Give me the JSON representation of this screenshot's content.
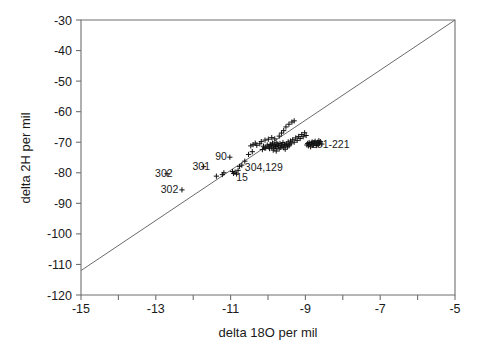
{
  "chart_data": {
    "type": "scatter",
    "title": "",
    "xlabel": "delta 18O  per mil",
    "ylabel": "delta 2H  per mil",
    "xlim": [
      -15,
      -5
    ],
    "ylim": [
      -120,
      -30
    ],
    "xticks": [
      -15,
      -14,
      -13,
      -12,
      -11,
      -10,
      -9,
      -8,
      -7,
      -6,
      -5
    ],
    "xtick_labels": [
      "-15",
      "",
      "-13",
      "",
      "-11",
      "",
      "-9",
      "",
      "-7",
      "",
      "-5"
    ],
    "yticks": [
      -120,
      -110,
      -100,
      -90,
      -80,
      -70,
      -60,
      -50,
      -40,
      -30
    ],
    "ytick_labels": [
      "-120",
      "-110",
      "-100",
      "-90",
      "-80",
      "-70",
      "-60",
      "-50",
      "-40",
      "-30"
    ],
    "grid": false,
    "legend": "none",
    "marker_symbol": "plus",
    "marker_color": "#111111",
    "reference_line": {
      "name": "meteoric-water-line",
      "x": [
        -15,
        -5
      ],
      "y": [
        -112.0,
        -30.0
      ],
      "color": "#6b6b6b"
    },
    "annotations": [
      {
        "text": "302",
        "x": -12.55,
        "y": -80.2,
        "anchor": "end"
      },
      {
        "text": "302",
        "x": -12.4,
        "y": -85.5,
        "anchor": "end"
      },
      {
        "text": "301",
        "x": -11.55,
        "y": -77.8,
        "anchor": "end"
      },
      {
        "text": "90",
        "x": -11.1,
        "y": -74.6,
        "anchor": "end"
      },
      {
        "text": "15",
        "x": -10.85,
        "y": -81.4,
        "anchor": "start"
      },
      {
        "text": "304,129",
        "x": -10.62,
        "y": -78.3,
        "anchor": "start"
      },
      {
        "text": "201-221",
        "x": -8.85,
        "y": -70.6,
        "anchor": "start"
      }
    ],
    "points": [
      {
        "x": -12.7,
        "y": -80.3
      },
      {
        "x": -12.3,
        "y": -85.6
      },
      {
        "x": -11.72,
        "y": -78.0
      },
      {
        "x": -11.38,
        "y": -81.1
      },
      {
        "x": -11.22,
        "y": -80.6
      },
      {
        "x": -11.18,
        "y": -80.0
      },
      {
        "x": -11.02,
        "y": -74.9
      },
      {
        "x": -10.95,
        "y": -79.6
      },
      {
        "x": -10.92,
        "y": -80.2
      },
      {
        "x": -10.88,
        "y": -79.8
      },
      {
        "x": -10.84,
        "y": -80.4
      },
      {
        "x": -10.8,
        "y": -79.2
      },
      {
        "x": -10.76,
        "y": -77.9
      },
      {
        "x": -10.7,
        "y": -77.5
      },
      {
        "x": -10.62,
        "y": -76.2
      },
      {
        "x": -10.52,
        "y": -74.0
      },
      {
        "x": -10.42,
        "y": -73.1
      },
      {
        "x": -10.3,
        "y": -71.0
      },
      {
        "x": -10.22,
        "y": -70.5
      },
      {
        "x": -10.12,
        "y": -71.3
      },
      {
        "x": -10.06,
        "y": -71.8
      },
      {
        "x": -10.02,
        "y": -70.9
      },
      {
        "x": -9.98,
        "y": -71.5
      },
      {
        "x": -9.96,
        "y": -72.1
      },
      {
        "x": -9.94,
        "y": -70.7
      },
      {
        "x": -9.92,
        "y": -71.0
      },
      {
        "x": -9.9,
        "y": -71.6
      },
      {
        "x": -9.88,
        "y": -70.3
      },
      {
        "x": -9.86,
        "y": -71.2
      },
      {
        "x": -9.84,
        "y": -72.0
      },
      {
        "x": -9.82,
        "y": -70.8
      },
      {
        "x": -9.8,
        "y": -71.4
      },
      {
        "x": -9.78,
        "y": -70.2
      },
      {
        "x": -9.76,
        "y": -71.9
      },
      {
        "x": -9.74,
        "y": -70.6
      },
      {
        "x": -9.72,
        "y": -71.1
      },
      {
        "x": -9.7,
        "y": -72.2
      },
      {
        "x": -9.68,
        "y": -70.4
      },
      {
        "x": -9.66,
        "y": -71.7
      },
      {
        "x": -9.64,
        "y": -70.9
      },
      {
        "x": -9.62,
        "y": -71.3
      },
      {
        "x": -9.6,
        "y": -70.1
      },
      {
        "x": -9.58,
        "y": -71.8
      },
      {
        "x": -9.56,
        "y": -70.7
      },
      {
        "x": -9.54,
        "y": -72.3
      },
      {
        "x": -9.52,
        "y": -71.0
      },
      {
        "x": -9.5,
        "y": -70.5
      },
      {
        "x": -9.48,
        "y": -71.5
      },
      {
        "x": -9.46,
        "y": -69.9
      },
      {
        "x": -9.44,
        "y": -71.2
      },
      {
        "x": -9.42,
        "y": -70.8
      },
      {
        "x": -9.4,
        "y": -69.6
      },
      {
        "x": -9.38,
        "y": -70.3
      },
      {
        "x": -9.34,
        "y": -69.2
      },
      {
        "x": -9.3,
        "y": -70.0
      },
      {
        "x": -9.26,
        "y": -68.6
      },
      {
        "x": -9.22,
        "y": -69.4
      },
      {
        "x": -9.18,
        "y": -68.1
      },
      {
        "x": -9.14,
        "y": -68.8
      },
      {
        "x": -9.1,
        "y": -67.5
      },
      {
        "x": -9.06,
        "y": -68.2
      },
      {
        "x": -9.02,
        "y": -66.9
      },
      {
        "x": -8.98,
        "y": -67.8
      },
      {
        "x": -8.96,
        "y": -70.9
      },
      {
        "x": -8.94,
        "y": -70.4
      },
      {
        "x": -8.92,
        "y": -71.2
      },
      {
        "x": -8.9,
        "y": -70.1
      },
      {
        "x": -8.88,
        "y": -70.7
      },
      {
        "x": -8.86,
        "y": -71.5
      },
      {
        "x": -8.84,
        "y": -70.3
      },
      {
        "x": -8.82,
        "y": -69.9
      },
      {
        "x": -8.8,
        "y": -70.6
      },
      {
        "x": -8.78,
        "y": -71.0
      },
      {
        "x": -8.76,
        "y": -70.2
      },
      {
        "x": -8.74,
        "y": -69.7
      },
      {
        "x": -8.72,
        "y": -70.5
      },
      {
        "x": -8.7,
        "y": -71.1
      },
      {
        "x": -8.68,
        "y": -70.0
      },
      {
        "x": -8.66,
        "y": -70.8
      },
      {
        "x": -8.64,
        "y": -69.5
      },
      {
        "x": -8.62,
        "y": -70.4
      },
      {
        "x": -8.6,
        "y": -69.8
      },
      {
        "x": -8.56,
        "y": -70.6
      },
      {
        "x": -9.44,
        "y": -64.1
      },
      {
        "x": -9.36,
        "y": -63.4
      },
      {
        "x": -9.3,
        "y": -63.0
      },
      {
        "x": -9.52,
        "y": -65.0
      },
      {
        "x": -9.58,
        "y": -66.2
      },
      {
        "x": -9.64,
        "y": -67.0
      },
      {
        "x": -9.7,
        "y": -68.0
      },
      {
        "x": -10.18,
        "y": -69.8
      },
      {
        "x": -10.08,
        "y": -69.3
      },
      {
        "x": -9.99,
        "y": -69.0
      },
      {
        "x": -9.9,
        "y": -68.5
      },
      {
        "x": -9.82,
        "y": -68.9
      },
      {
        "x": -10.34,
        "y": -70.3
      },
      {
        "x": -10.4,
        "y": -70.8
      },
      {
        "x": -10.46,
        "y": -71.2
      },
      {
        "x": -10.15,
        "y": -72.4
      },
      {
        "x": -10.08,
        "y": -72.0
      },
      {
        "x": -9.86,
        "y": -72.6
      },
      {
        "x": -9.78,
        "y": -72.9
      }
    ]
  }
}
